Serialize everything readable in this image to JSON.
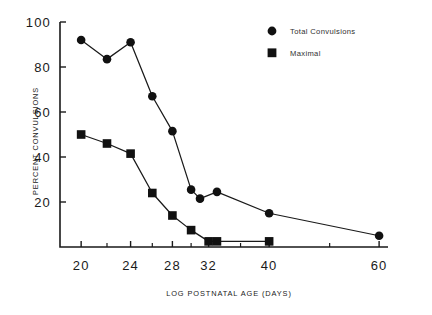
{
  "chart_data": {
    "type": "line",
    "title": "",
    "xlabel": "LOG POSTNATAL AGE (DAYS)",
    "ylabel": "PERCENT CONVULSIONS",
    "xscale": "log",
    "xlim": [
      18.5,
      62
    ],
    "ylim": [
      0,
      100
    ],
    "xticks": [
      20,
      24,
      28,
      32,
      40,
      60
    ],
    "xtick_labels": [
      "20",
      "24",
      "28",
      "32",
      "40",
      "60"
    ],
    "yticks": [
      20,
      40,
      60,
      80,
      100
    ],
    "ytick_labels": [
      "20",
      "40",
      "60",
      "80",
      "100"
    ],
    "grid": false,
    "legend_position": "top-right",
    "series": [
      {
        "name": "Total Convulsions",
        "marker": "circle",
        "x": [
          20,
          22,
          24,
          26,
          28,
          30,
          31,
          33,
          40,
          60
        ],
        "values": [
          92,
          83.5,
          91,
          67,
          51.5,
          25.5,
          21.5,
          24.5,
          15,
          5
        ]
      },
      {
        "name": "Maximal",
        "marker": "square",
        "x": [
          20,
          22,
          24,
          26,
          28,
          30,
          32,
          33,
          40
        ],
        "values": [
          50,
          46,
          41.5,
          24,
          14,
          7.5,
          2.5,
          2.5,
          2.5
        ]
      }
    ]
  },
  "legend": {
    "items": [
      {
        "label": "Total Convulsions",
        "marker": "circle"
      },
      {
        "label": "Maximal",
        "marker": "square"
      }
    ]
  },
  "colors": {
    "ink": "#1a1a1a",
    "marker": "#111111",
    "background": "#ffffff"
  }
}
